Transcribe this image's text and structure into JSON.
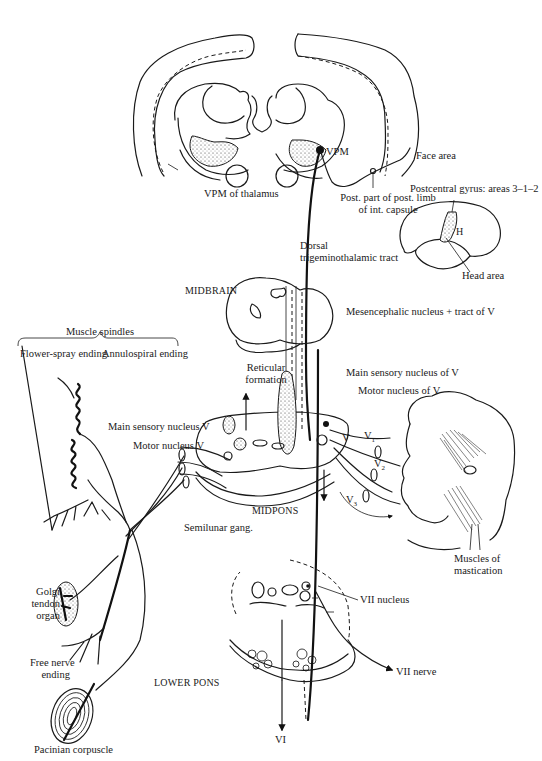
{
  "figure": {
    "thalamus_level": {
      "vpm_of_thalamus": "VPM of thalamus",
      "vpm": "VPM",
      "face_area": "Face area",
      "internal_capsule": [
        "Post. part of post. limb",
        "of int. capsule"
      ],
      "postcentral_gyrus": "Postcentral gyrus: areas 3–1–2",
      "h_marker": "H",
      "head_area": "Head area",
      "dorsal_tract": [
        "Dorsal",
        "trigeminothalamic tract"
      ]
    },
    "midbrain_level": {
      "section_label": "MIDBRAIN",
      "mesencephalic": "Mesencephalic nucleus + tract of V"
    },
    "muscle_spindles": {
      "title": "Muscle spindles",
      "flower_spray": "Flower-spray ending",
      "annulospiral": "Annulospiral ending"
    },
    "midpons_level": {
      "section_label": "MIDPONS",
      "reticular_formation": [
        "Reticular",
        "formation"
      ],
      "main_sensory_nucleus_v_left": "Main sensory nucleus V",
      "motor_nucleus_v_left": "Motor nucleus V",
      "main_sensory_nucleus_of_v": "Main sensory nucleus of V",
      "motor_nucleus_of_v": "Motor nucleus of V",
      "semilunar_gang": "Semilunar gang.",
      "nerve_v": "V",
      "nerve_v1": {
        "base": "V",
        "sub": "1"
      },
      "nerve_v2": {
        "base": "V",
        "sub": "2"
      },
      "nerve_v3": {
        "base": "V",
        "sub": "3"
      },
      "muscles_of_mastication": [
        "Muscles of",
        "mastication"
      ]
    },
    "receptors": {
      "golgi_tendon_organ": [
        "Golgi",
        "tendon",
        "organ"
      ],
      "free_nerve_ending": [
        "Free nerve",
        "ending"
      ],
      "pacinian_corpuscle": "Pacinian corpuscle"
    },
    "lower_pons_level": {
      "section_label": "LOWER PONS",
      "vii_nucleus": "VII  nucleus",
      "vii_nerve": "VII  nerve",
      "vi": "VI"
    }
  }
}
